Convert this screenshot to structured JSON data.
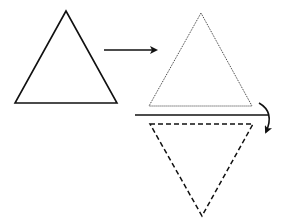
{
  "diagram": {
    "stroke_color": "#111111",
    "background": "#ffffff",
    "shapes": {
      "original_triangle": {
        "style": "solid",
        "points": [
          [
            66,
            11
          ],
          [
            15,
            103
          ],
          [
            117,
            103
          ]
        ]
      },
      "translated_triangle": {
        "style": "dotted",
        "points": [
          [
            201,
            13
          ],
          [
            149,
            106
          ],
          [
            252,
            106
          ]
        ]
      },
      "reflected_triangle": {
        "style": "dashed",
        "points": [
          [
            150,
            124
          ],
          [
            253,
            124
          ],
          [
            202,
            216
          ]
        ]
      }
    },
    "mirror_line": {
      "x1": 135,
      "y1": 115,
      "x2": 268,
      "y2": 115
    },
    "translate_arrow": {
      "x1": 104,
      "y1": 50,
      "x2": 157,
      "y2": 50
    },
    "flip_arrow": {
      "from": [
        261,
        103
      ],
      "to": [
        267,
        134
      ]
    }
  }
}
